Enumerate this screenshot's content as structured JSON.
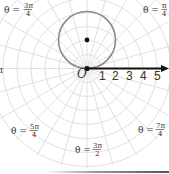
{
  "diagram": {
    "type": "polar-graph",
    "origin_label": "O",
    "axis_ticks": [
      "1",
      "2",
      "3",
      "4",
      "5"
    ],
    "angle_labels": [
      {
        "id": "3pi4",
        "prefix": "θ =",
        "num": "3π",
        "den": "4"
      },
      {
        "id": "pi4",
        "prefix": "θ =",
        "num": "π",
        "den": "4"
      },
      {
        "id": "pi",
        "prefix": "",
        "num": "π",
        "den": ""
      },
      {
        "id": "5pi4",
        "prefix": "θ =",
        "num": "5π",
        "den": "4"
      },
      {
        "id": "7pi4",
        "prefix": "θ =",
        "num": "7π",
        "den": "4"
      },
      {
        "id": "3pi2",
        "prefix": "θ =",
        "num": "3π",
        "den": "2"
      }
    ],
    "curve": {
      "equation": "r = 4 sin θ",
      "center_polar": [
        2,
        "π/2"
      ],
      "radius": 2
    },
    "colors": {
      "grid": "#dcdcdc",
      "curve": "#8a8a8a",
      "axis": "#111111",
      "text": "#333333"
    }
  }
}
